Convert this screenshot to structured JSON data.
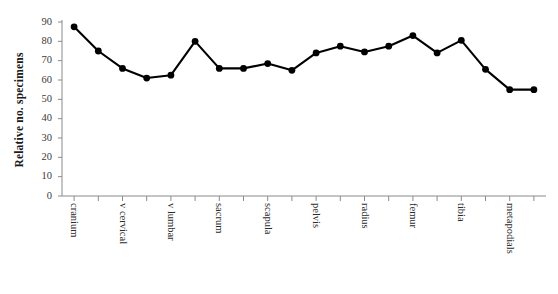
{
  "chart_data": {
    "type": "line",
    "title": "",
    "subtitle": "",
    "xlabel": "",
    "ylabel": "Relative no. specimens",
    "ylim": [
      0,
      90
    ],
    "ytick_step": 10,
    "yticks": [
      0,
      10,
      20,
      30,
      40,
      50,
      60,
      70,
      80,
      90
    ],
    "grid": false,
    "legend": "none",
    "marker": "filled-circle",
    "line_color": "#000000",
    "marker_color": "#000000",
    "n_points": 20,
    "x_tick_count": 20,
    "x_labels_every": 2,
    "categories": [
      "cranium",
      "",
      "v cervical",
      "",
      "v lumbar",
      "",
      "sacrum",
      "",
      "scapula",
      "",
      "pelvis",
      "",
      "radius",
      "",
      "femur",
      "",
      "tibia",
      "",
      "metapodials",
      ""
    ],
    "xtick_labels": [
      "cranium",
      "v cervical",
      "v lumbar",
      "sacrum",
      "scapula",
      "pelvis",
      "radius",
      "femur",
      "tibia",
      "metapodials"
    ],
    "values": [
      87.5,
      75.0,
      66.0,
      61.0,
      62.5,
      80.0,
      66.0,
      66.0,
      68.5,
      65.0,
      74.0,
      77.5,
      74.5,
      77.5,
      83.0,
      74.0,
      80.5,
      65.5,
      55.0,
      55.0
    ],
    "series": [
      {
        "name": "Relative no. specimens",
        "values": [
          87.5,
          75.0,
          66.0,
          61.0,
          62.5,
          80.0,
          66.0,
          66.0,
          68.5,
          65.0,
          74.0,
          77.5,
          74.5,
          77.5,
          83.0,
          74.0,
          80.5,
          65.5,
          55.0,
          55.0
        ]
      }
    ]
  },
  "axis": {
    "y_title": "Relative no. specimens",
    "y_tick_labels": [
      "90",
      "80",
      "70",
      "60",
      "50",
      "40",
      "30",
      "20",
      "10",
      "0"
    ]
  }
}
